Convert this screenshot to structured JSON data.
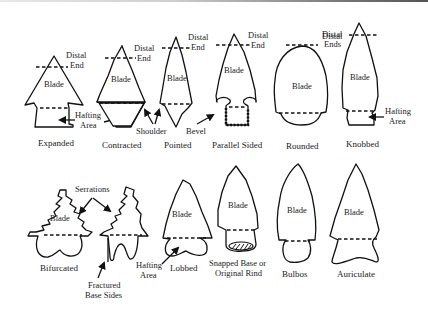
{
  "figure": {
    "labels": {
      "distal_end": [
        "Distal",
        "End"
      ],
      "distal_ends": [
        "Distal",
        "Ends"
      ],
      "blade": "Blade",
      "hafting_area": [
        "Hafting",
        "Area"
      ],
      "shoulder": "Shoulder",
      "bevel": "Bevel",
      "serrations": "Serrations",
      "fractured_base_sides": [
        "Fractured",
        "Base Sides"
      ],
      "snapped_base": [
        "Snapped Base or",
        "Original Rind"
      ]
    },
    "row1": [
      {
        "id": "expanded",
        "caption": "Expanded"
      },
      {
        "id": "contracted",
        "caption": "Contracted"
      },
      {
        "id": "pointed",
        "caption": "Pointed"
      },
      {
        "id": "parallel-sided",
        "caption": "Parallel Sided"
      },
      {
        "id": "rounded",
        "caption": "Rounded"
      },
      {
        "id": "knobbed",
        "caption": "Knobbed"
      }
    ],
    "row2": [
      {
        "id": "bifurcated",
        "caption": "Bifurcated"
      },
      {
        "id": "fractured",
        "caption": ""
      },
      {
        "id": "lobbed",
        "caption": "Lobbed"
      },
      {
        "id": "snapped",
        "caption": ""
      },
      {
        "id": "bulbos",
        "caption": "Bulbos"
      },
      {
        "id": "auriculate",
        "caption": "Auriculate"
      }
    ]
  }
}
